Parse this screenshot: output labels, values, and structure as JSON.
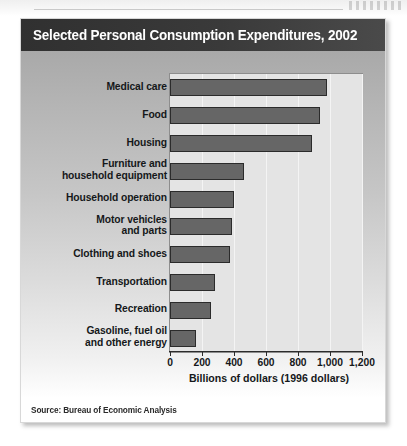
{
  "chart_title": "Selected Personal Consumption Expenditures, 2002",
  "source_note": "Source: Bureau of Economic Analysis",
  "chart_data": {
    "type": "bar",
    "orientation": "horizontal",
    "title": "Selected Personal Consumption Expenditures, 2002",
    "xlabel": "Billions of dollars (1996 dollars)",
    "ylabel": "",
    "xlim": [
      0,
      1200
    ],
    "xticks": [
      0,
      200,
      400,
      600,
      800,
      1000,
      1200
    ],
    "xtick_labels": [
      "0",
      "200",
      "400",
      "600",
      "800",
      "1,000",
      "1,200"
    ],
    "grid": true,
    "legend": "none",
    "bar_color": "#666666",
    "bar_edge_color": "#2b2b2b",
    "plot_background": "#e4e4e4",
    "categories": [
      "Medical care",
      "Food",
      "Housing",
      "Furniture and household equipment",
      "Household operation",
      "Motor vehicles and parts",
      "Clothing and shoes",
      "Transportation",
      "Recreation",
      "Gasoline, fuel oil and other energy"
    ],
    "values": [
      980,
      935,
      890,
      460,
      400,
      390,
      375,
      280,
      255,
      165
    ],
    "source": "Bureau of Economic Analysis"
  },
  "category_lines": [
    [
      "Medical care",
      ""
    ],
    [
      "Food",
      ""
    ],
    [
      "Housing",
      ""
    ],
    [
      "Furniture and",
      "household equipment"
    ],
    [
      "Household operation",
      ""
    ],
    [
      "Motor vehicles",
      "and parts"
    ],
    [
      "Clothing and shoes",
      ""
    ],
    [
      "Transportation",
      ""
    ],
    [
      "Recreation",
      ""
    ],
    [
      "Gasoline, fuel oil",
      "and other energy"
    ]
  ]
}
